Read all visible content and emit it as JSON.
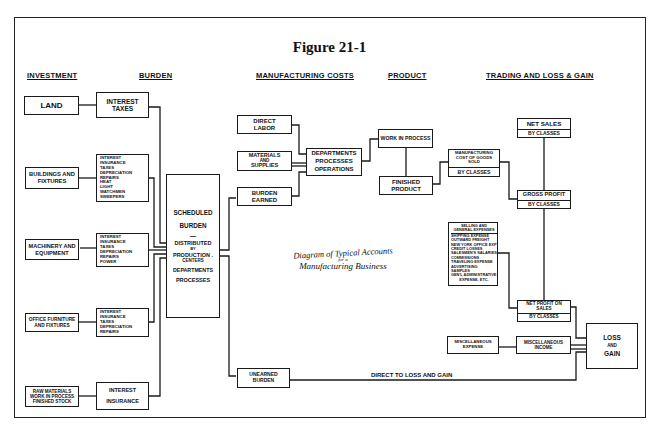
{
  "figure_title": "Figure 21-1",
  "diagram_title": {
    "line1": "Diagram of Typical Accounts",
    "line2": "for a",
    "line3": "Manufacturing Business"
  },
  "column_headers": {
    "investment": "INVESTMENT",
    "burden": "BURDEN",
    "manufacturing_costs": "MANUFACTURING COSTS",
    "product": "PRODUCT",
    "trading": "TRADING AND LOSS & GAIN"
  },
  "investment_boxes": {
    "land": [
      "LAND"
    ],
    "buildings": [
      "BUILDINGS AND",
      "FIXTURES"
    ],
    "machinery": [
      "MACHINERY AND",
      "EQUIPMENT"
    ],
    "office": [
      "OFFICE FURNITURE",
      "AND FIXTURES"
    ],
    "raw": [
      "RAW MATERIALS",
      "WORK IN PROCESS",
      "FINISHED STOCK"
    ]
  },
  "burden_boxes": {
    "land": [
      "INTEREST",
      "TAXES"
    ],
    "buildings": [
      "INTEREST",
      "INSURANCE",
      "TAXES",
      "DEPRECIATION",
      "REPAIRS",
      "HEAT",
      "LIGHT",
      "WATCHMEN",
      "SWEEPERS"
    ],
    "machinery": [
      "INTEREST",
      "INSURANCE",
      "TAXES",
      "DEPRECIATION",
      "REPAIRS",
      "POWER"
    ],
    "office": [
      "INTEREST",
      "INSURANCE",
      "TAXES",
      "DEPRECIATION",
      "REPAIRS"
    ],
    "raw": [
      "INTEREST",
      "INSURANCE"
    ]
  },
  "scheduled_burden": {
    "line1": "SCHEDULED",
    "line2": "BURDEN",
    "dash": "—",
    "line3": "DISTRIBUTED",
    "line4": "BY",
    "line5": "PRODUCTION .",
    "line6": "CENTERS",
    "line7": "DEPARTMENTS",
    "line8": "PROCESSES"
  },
  "manufacturing_boxes": {
    "direct_labor": [
      "DIRECT",
      "LABOR"
    ],
    "materials": [
      "MATERIALS",
      "AND",
      "SUPPLIES"
    ],
    "burden_earned": [
      "BURDEN",
      "EARNED"
    ],
    "departments": [
      "DEPARTMENTS",
      "PROCESSES",
      "OPERATIONS"
    ],
    "unearned_burden": [
      "UNEARNED",
      "BURDEN"
    ]
  },
  "product_boxes": {
    "work_in_process": [
      "WORK IN PROCESS"
    ],
    "finished_product": [
      "FINISHED",
      "PRODUCT"
    ]
  },
  "trading_boxes": {
    "net_sales": {
      "main": "NET SALES",
      "sub": "BY CLASSES"
    },
    "mfg_cost": {
      "main": [
        "MANUFACTURING",
        "COST OF GOODS",
        "SOLD"
      ],
      "sub": "BY CLASSES"
    },
    "gross_profit": {
      "main": "GROSS PROFIT",
      "sub": "BY CLASSES"
    },
    "selling": {
      "main": [
        "SELLING AND",
        "GENERAL EXPENSES"
      ],
      "items": [
        "SHIPPING EXPENSE",
        "OUTWARD FREIGHT",
        "NEW YORK OFFICE EXP",
        "CREDIT LOSSES",
        "SALESMEN'S SALARIES",
        "COMMISSIONS",
        "TRAVELING EXPENSE",
        "ADVERTISING",
        "SAMPLES",
        "GEN'L ADMINISTRATIVE",
        "EXPENSE, ETC."
      ]
    },
    "net_profit": {
      "main": [
        "NET PROFIT ON",
        "SALES"
      ],
      "sub": "BY CLASSES"
    },
    "misc_expense": [
      "MISCELLANEOUS",
      "EXPENSE"
    ],
    "misc_income": [
      "MISCELLANEOUS",
      "INCOME"
    ],
    "loss_gain": [
      "LOSS",
      "AND",
      "GAIN"
    ]
  },
  "connector_labels": {
    "direct_to_loss": "DIRECT TO LOSS AND GAIN"
  },
  "colors": {
    "ink": "#1a1a1a",
    "paper": "#ffffff"
  }
}
